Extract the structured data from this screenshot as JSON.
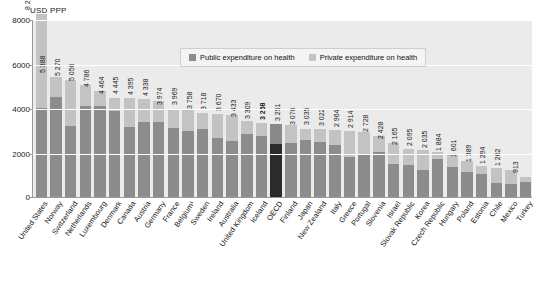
{
  "chart_data": {
    "type": "bar",
    "title": "",
    "subtitle": "",
    "xlabel": "",
    "ylabel": "USD PPP",
    "ylim": [
      0,
      8000
    ],
    "yticks": [
      0,
      2000,
      4000,
      6000,
      8000
    ],
    "grid": true,
    "stacked": true,
    "legend_position": "top-center",
    "legend": [
      "Public expenditure on health",
      "Private expenditure on health"
    ],
    "highlight_category": "OECD",
    "categories": [
      "United States",
      "Norway",
      "Switzerland",
      "Netherlands",
      "Luxembourg",
      "Denmark",
      "Canada",
      "Austria",
      "Germany",
      "France",
      "Belgium¹",
      "Sweden",
      "Ireland",
      "Australia",
      "United Kingdom",
      "Iceland",
      "OECD",
      "Finland",
      "Japan",
      "New Zealand",
      "Italy",
      "Greece",
      "Portugal",
      "Slovenia",
      "Israel",
      "Slovak Republic",
      "Korea",
      "Czech Republic",
      "Hungary",
      "Poland",
      "Estonia",
      "Chile",
      "Mexico",
      "Turkey"
    ],
    "values": [
      8233,
      5388,
      5270,
      5056,
      4786,
      4464,
      4445,
      4395,
      4338,
      3974,
      3969,
      3758,
      3718,
      3670,
      3433,
      3309,
      3268,
      3251,
      3076,
      3035,
      3022,
      2964,
      2914,
      2728,
      2428,
      2165,
      2095,
      2035,
      1884,
      1601,
      1389,
      1294,
      1202,
      913
    ],
    "value_labels": [
      "8 233",
      "5 388",
      "5 270",
      "5 056",
      "4 786",
      "4 464",
      "4 445",
      "4 395",
      "4 338",
      "3 974",
      "3 969",
      "3 758",
      "3 718",
      "3 670",
      "3 433",
      "3 309",
      "3 268",
      "3 251",
      "3 076",
      "3 035",
      "3 022",
      "2 964",
      "2 914",
      "2 728",
      "2 428",
      "2 165",
      "2 095",
      "2 035",
      "1 884",
      "1 601",
      "1 389",
      "1 294",
      "1 202",
      "913"
    ],
    "series": [
      {
        "name": "Public expenditure on health",
        "values": [
          4000,
          4500,
          3200,
          4100,
          4100,
          3850,
          3150,
          3370,
          3350,
          3080,
          2980,
          3070,
          2650,
          2500,
          2850,
          2720,
          2400,
          2450,
          2550,
          2470,
          2330,
          1810,
          1940,
          2010,
          1480,
          1430,
          1220,
          1720,
          1330,
          1120,
          1030,
          620,
          590,
          670
        ]
      },
      {
        "name": "Private expenditure on health",
        "values": [
          4233,
          888,
          2070,
          956,
          686,
          614,
          1295,
          1025,
          988,
          894,
          989,
          688,
          1068,
          1170,
          583,
          589,
          868,
          801,
          526,
          565,
          692,
          1154,
          974,
          718,
          948,
          735,
          875,
          315,
          554,
          481,
          359,
          674,
          612,
          243
        ]
      }
    ]
  }
}
